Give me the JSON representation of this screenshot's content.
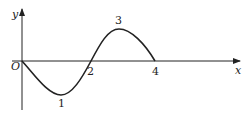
{
  "diagram": {
    "type": "function-graph",
    "axes": {
      "x_label": "x",
      "y_label": "y",
      "origin_label": "O"
    },
    "curve": {
      "description": "wave starting at origin, dipping to minimum at 1, crossing axis at 2, peaking at 3, returning to axis at 4",
      "points": [
        {
          "x": 0,
          "y": 0
        },
        {
          "x": 1,
          "y": "min"
        },
        {
          "x": 2,
          "y": 0
        },
        {
          "x": 3,
          "y": "max"
        },
        {
          "x": 4,
          "y": 0
        }
      ]
    },
    "point_labels": [
      "1",
      "2",
      "3",
      "4"
    ],
    "colors": {
      "line": "#222222",
      "background": "#ffffff"
    }
  }
}
